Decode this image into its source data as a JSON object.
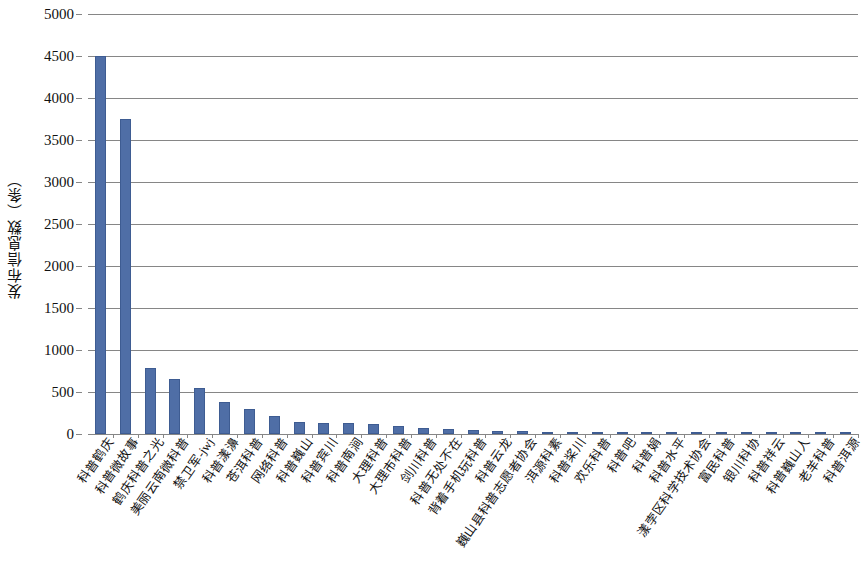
{
  "chart_data": {
    "type": "bar",
    "title": "",
    "xlabel": "",
    "ylabel": "发布信息数（条）",
    "ylim": [
      0,
      5000
    ],
    "ytick_step": 500,
    "yticks": [
      "0",
      "500",
      "1000",
      "1500",
      "2000",
      "2500",
      "3000",
      "3500",
      "4000",
      "4500",
      "5000"
    ],
    "grid": true,
    "legend": false,
    "bar_color": "#4f6ea6",
    "gridline_color": "#868686",
    "categories": [
      "科普鹤庆",
      "科普微故事",
      "鹤庆科普之光",
      "美丽云南微科普",
      "禁卫军-jwj",
      "科普漾濞",
      "苍洱科普",
      "网络科普",
      "科普巍山",
      "科普宾川",
      "科普南涧",
      "大理科普",
      "大理市科普",
      "剑川科普",
      "科普无处不在",
      "背着手机玩科普",
      "科普云龙",
      "巍山县科普志愿者协会",
      "洱源科素",
      "科普桨川",
      "欢乐科普",
      "科普吧",
      "科普娟",
      "科普水平",
      "漾孛区科学技术协会",
      "富民科普",
      "银川科协",
      "科普祥云",
      "科普巍山人",
      "老羊科普",
      "科普洱源"
    ],
    "values": [
      4500,
      3745,
      790,
      660,
      545,
      385,
      295,
      210,
      140,
      135,
      130,
      120,
      95,
      75,
      55,
      45,
      38,
      30,
      28,
      26,
      24,
      22,
      21,
      20,
      19,
      18,
      17,
      16,
      15,
      14,
      13
    ]
  }
}
